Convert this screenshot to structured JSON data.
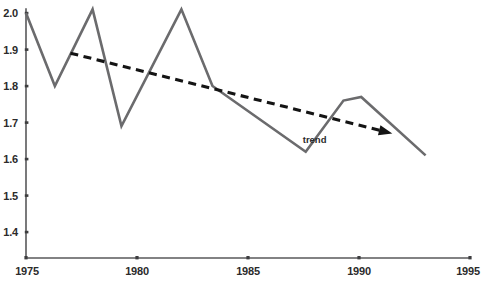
{
  "chart_data": {
    "type": "line",
    "title": "",
    "subtitle": "",
    "xlabel": "",
    "ylabel": "",
    "xlim": [
      1975,
      1995
    ],
    "ylim": [
      1.35,
      2.02
    ],
    "grid": false,
    "legend": "none",
    "x_ticks": [
      1975,
      1980,
      1985,
      1990,
      1995
    ],
    "x_tick_labels": [
      "1975",
      "1980",
      "1985",
      "1990",
      "1995"
    ],
    "y_ticks": [
      1.4,
      1.5,
      1.6,
      1.7,
      1.8,
      1.9,
      2.0
    ],
    "y_tick_labels": [
      "1.4",
      "1.5",
      "1.6",
      "1.7",
      "1.8",
      "1.9",
      "2.0"
    ],
    "series": [
      {
        "name": "data",
        "style": "solid",
        "color": "#6b6b6d",
        "x": [
          1975.0,
          1976.3,
          1978.0,
          1979.3,
          1982.0,
          1983.4,
          1987.6,
          1989.3,
          1990.1,
          1993.0
        ],
        "values": [
          2.0,
          1.8,
          2.01,
          1.69,
          2.01,
          1.8,
          1.62,
          1.76,
          1.77,
          1.61
        ]
      },
      {
        "name": "trend",
        "style": "dashed",
        "color": "#141414",
        "arrow_end": true,
        "x": [
          1977.0,
          1991.5
        ],
        "values": [
          1.89,
          1.67
        ]
      }
    ],
    "annotations": [
      {
        "name": "trend-label",
        "text": "trend",
        "x": 1988.0,
        "y": 1.645
      }
    ]
  },
  "axes": {
    "y_axis_name": "y-axis",
    "x_axis_name": "x-axis"
  }
}
